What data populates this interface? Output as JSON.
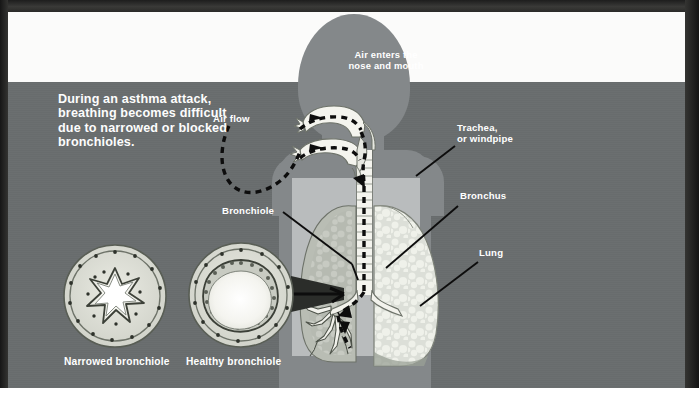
{
  "figure": {
    "intro_text": "During an asthma attack, breathing becomes difficult due to narrowed or blocked bronchioles."
  },
  "labels": {
    "air_enters": "Air enters the\nnose and mouth",
    "air_flow": "Air flow",
    "trachea": "Trachea,\nor windpipe",
    "bronchus": "Bronchus",
    "lung": "Lung",
    "bronchiole": "Bronchiole",
    "narrowed_bronchiole": "Narrowed bronchiole",
    "healthy_bronchiole": "Healthy bronchiole"
  },
  "icons": {
    "airflow_path": "dashed-airflow-arrow-icon",
    "leader_line": "leader-line-icon",
    "callout_connector": "callout-connector-icon"
  },
  "colors": {
    "page_border": "#2a2a28",
    "white_band": "#fbfbfa",
    "background_gray": "#696d6e",
    "body_silhouette": "#84888a",
    "chest_plate": "#b9bcbd",
    "lung_tissue": "#d9dcd6",
    "airway_light": "#f2f2ee",
    "label_text": "#ffffff",
    "leader_line": "#101010"
  }
}
